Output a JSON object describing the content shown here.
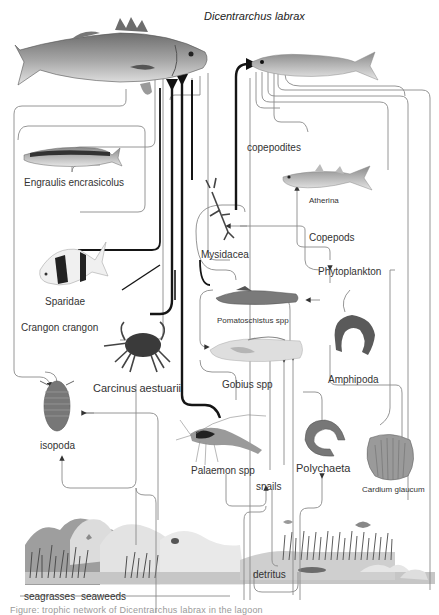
{
  "title": "Dicentrarchus labrax",
  "nodes": {
    "predator_top": "Dicentrarchus labrax",
    "engraulis": "Engraulis encrasicolus",
    "copepodites": "copepodites",
    "atherina": "Atherina",
    "mysidacea": "Mysidacea",
    "copepods": "Copepods",
    "phytoplankton": "Phytoplankton",
    "sparidae": "Sparidae",
    "crangon": "Crangon crangon",
    "pomatoschistus": "Pomatoschistus spp",
    "carcinus": "Carcinus aestuarii",
    "gobius": "Gobius spp",
    "amphipoda": "Amphipoda",
    "isopoda": "isopoda",
    "palaemon": "Palaemon spp",
    "snails": "snails",
    "polychaeta": "Polychaeta",
    "cardium": "Cardium glaucum",
    "detritus": "detritus",
    "seagrasses": "seagrasses",
    "seaweeds": "seaweeds"
  },
  "caption": "Figure: trophic network of Dicentrarchus labrax in the lagoon",
  "colors": {
    "line_thin": "#8a8a8a",
    "line_thick": "#1a1a1a",
    "seabed": "#bdbdbd",
    "rock": "#d9d9d9",
    "plants": "#5a5a5a"
  },
  "icons": {
    "sea_bass": "fish-illustration",
    "anchovy": "fish-illustration",
    "atherina_fish": "fish-illustration",
    "bream": "fish-illustration",
    "crab": "crab-illustration",
    "isopod": "isopod-illustration",
    "shrimp": "shrimp-illustration",
    "mysid": "mysid-illustration",
    "goby": "fish-illustration",
    "amphipod": "amphipod-illustration",
    "worm": "polychaete-illustration",
    "cockle": "shell-illustration",
    "seabed": "seabed-illustration"
  }
}
